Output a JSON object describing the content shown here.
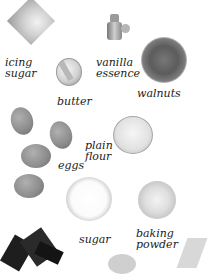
{
  "ingredients": [
    {
      "name": "icing sugar",
      "label_line1": "icing",
      "label_line2": "sugar"
    },
    {
      "name": "butter",
      "label_line1": "butter"
    },
    {
      "name": "vanilla essence",
      "label_line1": "vanilla",
      "label_line2": "essence"
    },
    {
      "name": "walnuts",
      "label_line1": "walnuts"
    },
    {
      "name": "eggs",
      "label_line1": "eggs"
    },
    {
      "name": "plain flour",
      "label_line1": "plain",
      "label_line2": "flour"
    },
    {
      "name": "sugar",
      "label_line1": "sugar"
    },
    {
      "name": "baking powder",
      "label_line1": "baking",
      "label_line2": "powder"
    }
  ]
}
